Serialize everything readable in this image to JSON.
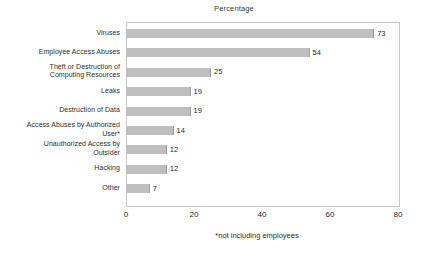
{
  "chart_data": {
    "type": "bar",
    "orientation": "horizontal",
    "title": "Percentage",
    "xlabel": "",
    "ylabel": "",
    "xlim": [
      0,
      80
    ],
    "xticks": [
      "0",
      "20",
      "40",
      "60",
      "80"
    ],
    "grid": false,
    "legend": false,
    "footnote": "*not including employees",
    "bar_color": "#bfbfbf",
    "bar_edge_color": "#9a9a9a",
    "frame_color": "#c8c8c8",
    "categories": [
      "Viruses",
      "Employee Access Abuses",
      "Theft or Destruction of Computing Resources",
      "Leaks",
      "Destruction of Data",
      "Access Abuses by Authorized User*",
      "Unauthorized Access by Outsider",
      "Hacking",
      "Other"
    ],
    "values": [
      73,
      54,
      25,
      19,
      19,
      14,
      12,
      12,
      7
    ],
    "bars": [
      {
        "label_line1": "Viruses",
        "label_line2": "",
        "value": 73,
        "value_label": "73"
      },
      {
        "label_line1": "Employee Access Abuses",
        "label_line2": "",
        "value": 54,
        "value_label": "54"
      },
      {
        "label_line1": "Theft or Destruction of",
        "label_line2": "Computing Resources",
        "value": 25,
        "value_label": "25"
      },
      {
        "label_line1": "Leaks",
        "label_line2": "",
        "value": 19,
        "value_label": "19"
      },
      {
        "label_line1": "Destruction of Data",
        "label_line2": "",
        "value": 19,
        "value_label": "19"
      },
      {
        "label_line1": "Access Abuses by Authorized",
        "label_line2": "User*",
        "value": 14,
        "value_label": "14"
      },
      {
        "label_line1": "Unauthorized Access by",
        "label_line2": "Outsider",
        "value": 12,
        "value_label": "12"
      },
      {
        "label_line1": "Hacking",
        "label_line2": "",
        "value": 12,
        "value_label": "12"
      },
      {
        "label_line1": "Other",
        "label_line2": "",
        "value": 7,
        "value_label": "7"
      }
    ]
  }
}
